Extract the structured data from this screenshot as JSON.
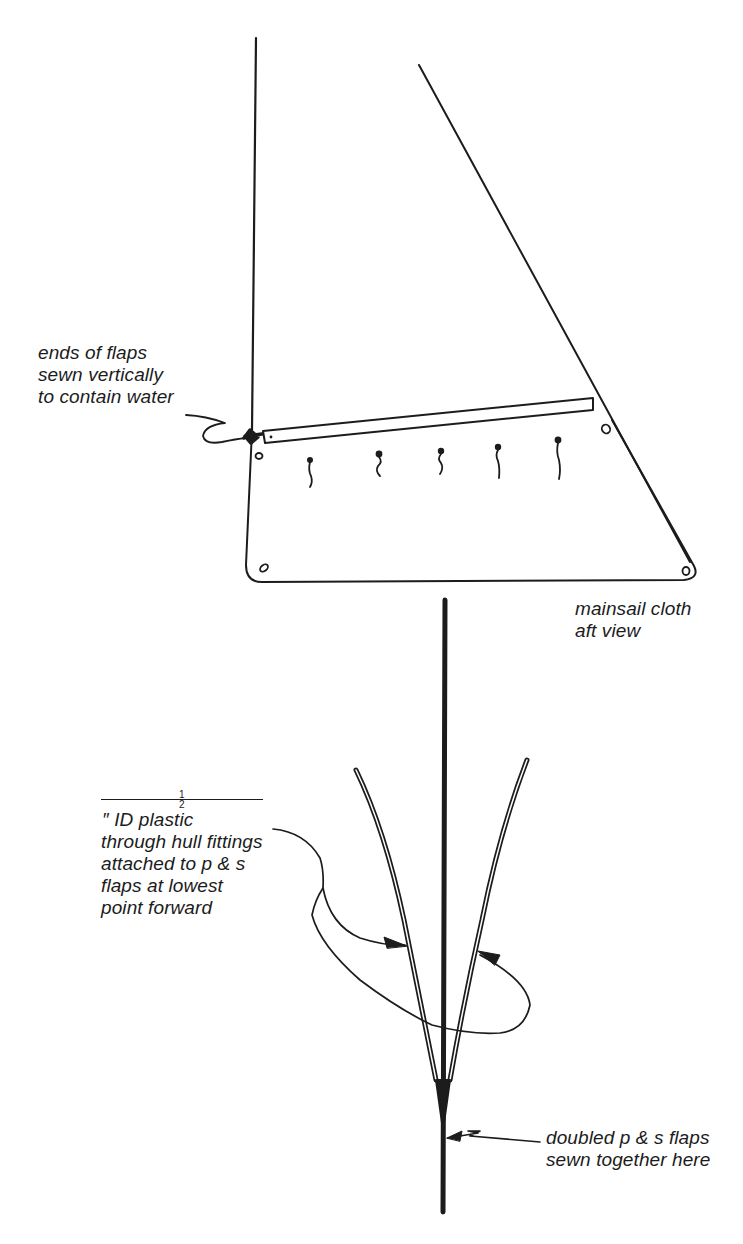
{
  "diagram": {
    "top_view": {
      "name": "mainsail cloth aft view",
      "caption": {
        "line1": "mainsail cloth",
        "line2": "aft view"
      },
      "callout_flap_ends": {
        "line1": "ends of flaps",
        "line2": "sewn vertically",
        "line3": "to contain water"
      },
      "grommet_count": 4,
      "drain_marker_count": 5
    },
    "bottom_view": {
      "callout_fittings": {
        "fraction_numerator": "1",
        "fraction_denominator": "2",
        "line1_rest": "″ ID plastic",
        "line2": "through hull fittings",
        "line3": "attached to p & s",
        "line4": "flaps at lowest",
        "line5": "point forward"
      },
      "callout_seam": {
        "line1": "doubled p & s flaps",
        "line2": "sewn together here"
      }
    },
    "colors": {
      "ink": "#1c1c1c",
      "paper": "#ffffff"
    }
  }
}
